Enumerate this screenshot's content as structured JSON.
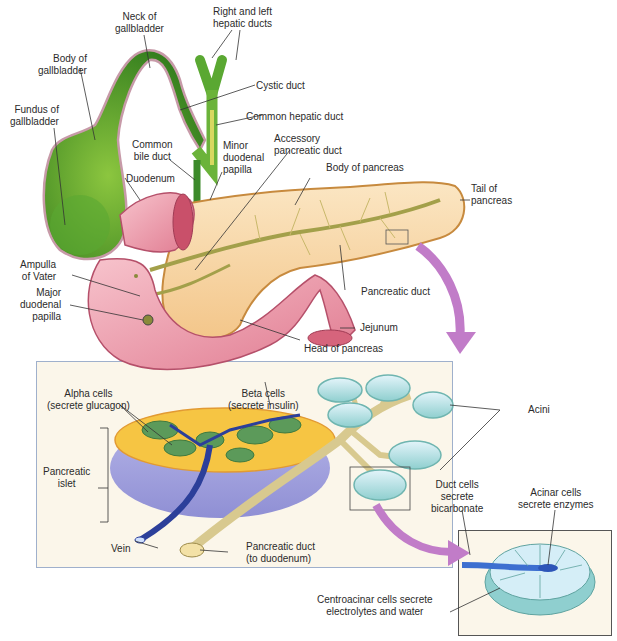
{
  "diagram": {
    "top_labels": {
      "neck_of_gallbladder": [
        "Neck of",
        "gallbladder"
      ],
      "right_left_hepatic_ducts": [
        "Right and left",
        "hepatic ducts"
      ],
      "body_of_gallbladder": [
        "Body of",
        "gallbladder"
      ],
      "cystic_duct": "Cystic duct",
      "fundus_of_gallbladder": [
        "Fundus of",
        "gallbladder"
      ],
      "common_hepatic_duct": "Common hepatic duct",
      "common_bile_duct": [
        "Common",
        "bile duct"
      ],
      "minor_duodenal_papilla": [
        "Minor",
        "duodenal",
        "papilla"
      ],
      "accessory_pancreatic_duct": [
        "Accessory",
        "pancreatic duct"
      ],
      "duodenum": "Duodenum",
      "body_of_pancreas": "Body of pancreas",
      "tail_of_pancreas": [
        "Tail of",
        "pancreas"
      ],
      "ampulla_of_vater": [
        "Ampulla",
        "of Vater"
      ],
      "major_duodenal_papilla": [
        "Major",
        "duodenal",
        "papilla"
      ],
      "pancreatic_duct": "Pancreatic duct",
      "jejunum": "Jejunum",
      "head_of_pancreas": "Head of pancreas"
    },
    "islet_panel": {
      "alpha_cells": [
        "Alpha cells",
        "(secrete glucagon)"
      ],
      "beta_cells": [
        "Beta cells",
        "(secrete insulin)"
      ],
      "pancreatic_islet": [
        "Pancreatic",
        "islet"
      ],
      "acini": "Acini",
      "vein": "Vein",
      "pancreatic_duct_to_duodenum": [
        "Pancreatic duct",
        "(to duodenum)"
      ]
    },
    "acinus_inset": {
      "duct_cells": [
        "Duct cells",
        "secrete",
        "bicarbonate"
      ],
      "acinar_cells": [
        "Acinar cells",
        "secrete enzymes"
      ],
      "centroacinar_cells": [
        "Centroacinar cells secrete",
        "electrolytes and water"
      ]
    },
    "colors": {
      "gallbladder": "#4e9a2a",
      "gallbladder_light": "#8cc63f",
      "duodenum": "#f2a7b4",
      "duodenum_dark": "#d6647c",
      "pancreas": "#f8dcae",
      "pancreas_edge": "#c78a3e",
      "duct": "#a3a04a",
      "arrow": "#c17cc8",
      "alpha_cell": "#5c9a5a",
      "beta_cell": "#f6c543",
      "islet_base": "#a9a8e0",
      "vein": "#2c3f9a",
      "acinus": "#bfe3ef",
      "acinus_edge": "#6fb5b0",
      "panel_bg": "#fbf6ea",
      "panel_border": "#9fb0cc"
    }
  }
}
